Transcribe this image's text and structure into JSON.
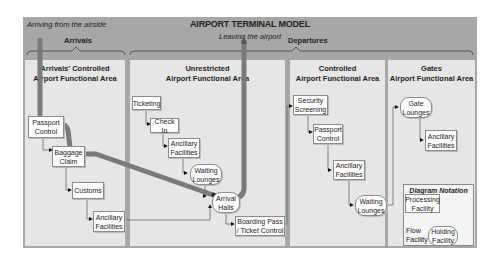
{
  "title": "AIRPORT TERMINAL MODEL",
  "notes": {
    "arriving": "Arriving from the airside",
    "leaving": "Leaving the airport"
  },
  "groups": {
    "arrivals": "Arrivals",
    "departures": "Departures"
  },
  "areas": [
    {
      "title_line1": "Arrivals' Controlled",
      "title_line2": "Airport Functional Area"
    },
    {
      "title_line1": "Unrestricted",
      "title_line2": "Airport Functional Area"
    },
    {
      "title_line1": "Controlled",
      "title_line2": "Airport Functional Area"
    },
    {
      "title_line1": "Gates",
      "title_line2": "Airport Functional Area"
    }
  ],
  "nodes": {
    "passport_control_arr": {
      "line1": "Passport",
      "line2": "Control",
      "type": "processing"
    },
    "baggage_claim": {
      "line1": "Baggage",
      "line2": "Claim",
      "type": "processing"
    },
    "customs": {
      "line1": "Customs",
      "line2": "",
      "type": "processing"
    },
    "ancillary_arr": {
      "line1": "Ancillary",
      "line2": "Facilities",
      "type": "processing"
    },
    "ticketing": {
      "line1": "Ticketing",
      "line2": "",
      "type": "processing"
    },
    "check_in": {
      "line1": "Check In",
      "line2": "",
      "type": "processing"
    },
    "ancillary_unres": {
      "line1": "Ancillary",
      "line2": "Facilities",
      "type": "processing"
    },
    "waiting_unres": {
      "line1": "Waiting",
      "line2": "Lounges",
      "type": "holding"
    },
    "arrival_halls": {
      "line1": "Arrival",
      "line2": "Halls",
      "type": "holding"
    },
    "boarding_pass": {
      "line1": "Boarding Pass",
      "line2": "/ Ticket Control",
      "type": "processing"
    },
    "security": {
      "line1": "Security",
      "line2": "Screening",
      "type": "processing"
    },
    "passport_control_dep": {
      "line1": "Passport",
      "line2": "Control",
      "type": "processing"
    },
    "ancillary_ctrl": {
      "line1": "Ancillary",
      "line2": "Facilities",
      "type": "processing"
    },
    "waiting_ctrl": {
      "line1": "Waiting",
      "line2": "Lounges",
      "type": "holding"
    },
    "gate_lounges": {
      "line1": "Gate",
      "line2": "Lounges",
      "type": "holding"
    },
    "ancillary_gates": {
      "line1": "Ancillary",
      "line2": "Facilities",
      "type": "processing"
    }
  },
  "legend": {
    "title": "Diagram Notation",
    "processing_line1": "Processing",
    "processing_line2": "Facility",
    "flow_line1": "Flow",
    "flow_line2": "Facility",
    "holding_line1": "Holding",
    "holding_line2": "Facility"
  },
  "colors": {
    "frame": "#a7a7a7",
    "area": "#e6e6e6",
    "passenger_path": "#7a7a7a"
  }
}
